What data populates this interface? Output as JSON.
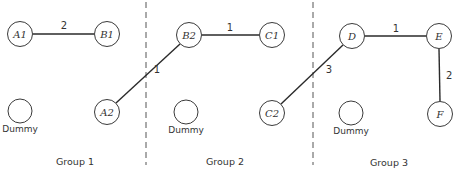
{
  "diagram": {
    "type": "graph-partition",
    "dividers": [
      {
        "x": 146,
        "y1": 2,
        "y2": 165
      },
      {
        "x": 313,
        "y1": 2,
        "y2": 165
      }
    ],
    "nodes": [
      {
        "id": "A1",
        "label": "A1",
        "x": 20,
        "y": 34
      },
      {
        "id": "B1",
        "label": "B1",
        "x": 107,
        "y": 34
      },
      {
        "id": "A2",
        "label": "A2",
        "x": 107,
        "y": 112
      },
      {
        "id": "B2",
        "label": "B2",
        "x": 189,
        "y": 35
      },
      {
        "id": "C1",
        "label": "C1",
        "x": 272,
        "y": 35
      },
      {
        "id": "C2",
        "label": "C2",
        "x": 272,
        "y": 113
      },
      {
        "id": "D",
        "label": "D",
        "x": 352,
        "y": 36
      },
      {
        "id": "E",
        "label": "E",
        "x": 439,
        "y": 36
      },
      {
        "id": "F",
        "label": "F",
        "x": 440,
        "y": 114
      }
    ],
    "dummies": [
      {
        "id": "dummy1",
        "label": "Dummy",
        "x": 20,
        "y": 111
      },
      {
        "id": "dummy2",
        "label": "Dummy",
        "x": 186,
        "y": 112
      },
      {
        "id": "dummy3",
        "label": "Dummy",
        "x": 351,
        "y": 113
      }
    ],
    "edges": [
      {
        "from": "A1",
        "to": "B1",
        "weight": "2"
      },
      {
        "from": "A2",
        "to": "B2",
        "weight": "1"
      },
      {
        "from": "B2",
        "to": "C1",
        "weight": "1"
      },
      {
        "from": "C2",
        "to": "D",
        "weight": "3"
      },
      {
        "from": "D",
        "to": "E",
        "weight": "1"
      },
      {
        "from": "E",
        "to": "F",
        "weight": "2"
      }
    ],
    "groups": [
      {
        "label": "Group 1",
        "x": 75,
        "y": 162
      },
      {
        "label": "Group 2",
        "x": 225,
        "y": 162
      },
      {
        "label": "Group 3",
        "x": 378,
        "y": 163
      }
    ]
  }
}
